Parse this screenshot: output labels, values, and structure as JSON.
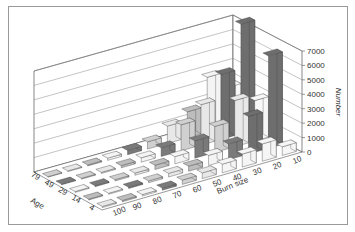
{
  "chart_data": {
    "type": "bar3d",
    "title": "",
    "xlabel": "Burn size",
    "ylabel": "Age",
    "zlabel": "Number",
    "x_categories": [
      "100",
      "90",
      "80",
      "70",
      "60",
      "50",
      "40",
      "30",
      "20",
      "10"
    ],
    "y_categories": [
      "4",
      "14",
      "29",
      "49",
      "79"
    ],
    "zlim": [
      0,
      7000
    ],
    "z_ticks": [
      "0",
      "1000",
      "2000",
      "3000",
      "4000",
      "5000",
      "6000",
      "7000"
    ],
    "grid": true,
    "series_by_age": [
      {
        "age": "4",
        "values": [
          80,
          90,
          100,
          150,
          300,
          400,
          600,
          900,
          1200,
          600
        ]
      },
      {
        "age": "14",
        "values": [
          60,
          70,
          90,
          130,
          250,
          350,
          700,
          1100,
          2600,
          6400
        ]
      },
      {
        "age": "29",
        "values": [
          60,
          70,
          90,
          150,
          300,
          500,
          1200,
          1800,
          3200,
          2800
        ]
      },
      {
        "age": "49",
        "values": [
          50,
          60,
          80,
          150,
          300,
          600,
          1800,
          2800,
          4500,
          7600
        ]
      },
      {
        "age": "79",
        "values": [
          40,
          50,
          70,
          150,
          300,
          500,
          1200,
          1800,
          3800,
          2700
        ]
      }
    ]
  },
  "axes": {
    "z_title": "Number",
    "x_title": "Burn size",
    "y_title": "Age"
  }
}
